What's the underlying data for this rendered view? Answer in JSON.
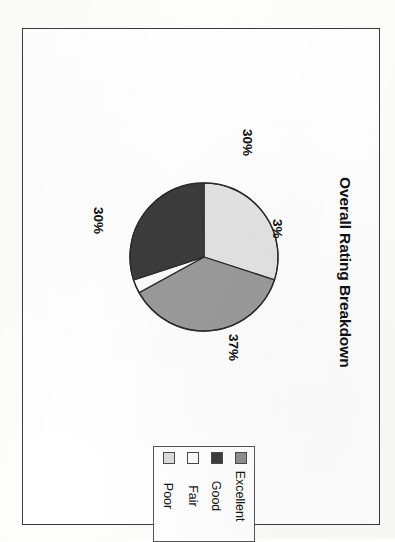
{
  "page": {
    "orientation": "rotated-90-clockwise",
    "background_color": "#fdfdfc",
    "frame_color": "#3a3a3a"
  },
  "chart": {
    "title": "Overall Rating Breakdown"
  },
  "chart_data": {
    "type": "pie",
    "title": "Overall Rating Breakdown",
    "xlabel": "",
    "ylabel": "",
    "categories": [
      "Excellent",
      "Good",
      "Fair",
      "Poor"
    ],
    "values": [
      30,
      37,
      3,
      30
    ],
    "value_labels": [
      "30%",
      "37%",
      "3%",
      "30%"
    ],
    "colors": [
      "#e3e3e3",
      "#9b9b9b",
      "#fbfbfb",
      "#3c3c3c"
    ],
    "legend_position": "bottom-left",
    "legend_order": [
      "Excellent",
      "Good",
      "Fair",
      "Poor"
    ],
    "grid": false,
    "slice_border_color": "#2b2b2b",
    "start_angle_deg": -90
  },
  "labels": {
    "excellent_pct": "30%",
    "good_pct": "37%",
    "fair_pct": "3%",
    "poor_pct": "30%"
  },
  "legend": {
    "items": [
      {
        "label": "Excellent",
        "color": "#8f8f8f"
      },
      {
        "label": "Good",
        "color": "#3c3c3c"
      },
      {
        "label": "Fair",
        "color": "#fbfbfb"
      },
      {
        "label": "Poor",
        "color": "#dcdcdc"
      }
    ]
  }
}
